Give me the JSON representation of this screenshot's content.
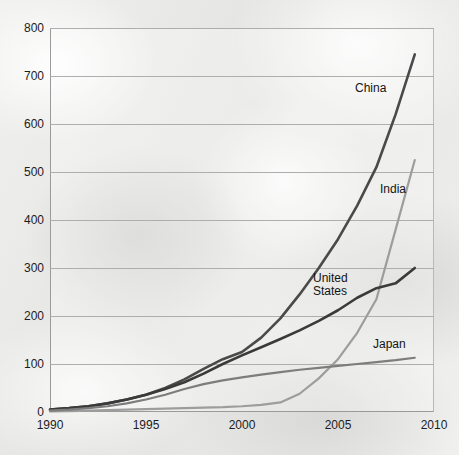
{
  "chart_data": {
    "type": "line",
    "title": "",
    "subtitle": "",
    "xlabel": "",
    "ylabel": "",
    "xlim": [
      1990,
      2010
    ],
    "ylim": [
      0,
      800
    ],
    "grid": true,
    "legend_position": "inline-labels",
    "x_ticks": [
      "1990",
      "1995",
      "2000",
      "2005",
      "2010"
    ],
    "x_tick_values": [
      1990,
      1995,
      2000,
      2005,
      2010
    ],
    "y_ticks": [
      "0",
      "100",
      "200",
      "300",
      "400",
      "500",
      "600",
      "700",
      "800"
    ],
    "y_tick_values": [
      0,
      100,
      200,
      300,
      400,
      500,
      600,
      700,
      800
    ],
    "x": [
      1990,
      1991,
      1992,
      1993,
      1994,
      1995,
      1996,
      1997,
      1998,
      1999,
      2000,
      2001,
      2002,
      2003,
      2004,
      2005,
      2006,
      2007,
      2008,
      2009
    ],
    "series": [
      {
        "name": "China",
        "color": "#4a4a4a",
        "label_text": "China",
        "values": [
          5,
          8,
          12,
          18,
          26,
          36,
          50,
          68,
          90,
          110,
          125,
          155,
          195,
          245,
          300,
          360,
          430,
          510,
          620,
          745
        ]
      },
      {
        "name": "India",
        "color": "#9d9d9d",
        "label_text": "India",
        "values": [
          1,
          2,
          3,
          4,
          5,
          6,
          7,
          8,
          9,
          10,
          12,
          15,
          20,
          38,
          70,
          110,
          165,
          235,
          380,
          525
        ]
      },
      {
        "name": "United States",
        "color": "#3a3a3a",
        "label_text": "United\nStates",
        "values": [
          5,
          8,
          12,
          18,
          26,
          36,
          48,
          62,
          80,
          100,
          118,
          135,
          152,
          170,
          190,
          212,
          238,
          258,
          268,
          300
        ]
      },
      {
        "name": "Japan",
        "color": "#7d7d7d",
        "label_text": "Japan",
        "values": [
          3,
          5,
          8,
          12,
          18,
          26,
          36,
          48,
          58,
          66,
          72,
          78,
          83,
          88,
          92,
          96,
          100,
          104,
          108,
          113
        ]
      }
    ],
    "annotations": [
      {
        "text": "China",
        "x": 2008,
        "y": 615
      },
      {
        "text": "India",
        "x": 2009,
        "y": 425
      },
      {
        "text": "United States",
        "x": 2005,
        "y": 248
      },
      {
        "text": "Japan",
        "x": 2007,
        "y": 150
      }
    ]
  }
}
